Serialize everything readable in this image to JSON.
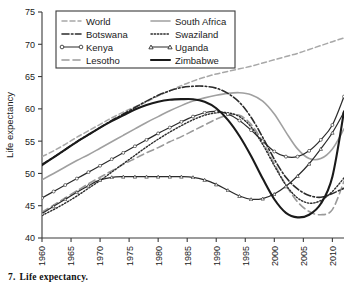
{
  "caption": {
    "number": "7.",
    "text": "Life expectancy."
  },
  "axes": {
    "ylabel": "Life expectancy",
    "xlabel": "",
    "yticks": [
      "40",
      "45",
      "50",
      "55",
      "60",
      "65",
      "70",
      "75"
    ],
    "xticks": [
      "1960",
      "1965",
      "1970",
      "1975",
      "1980",
      "1985",
      "1990",
      "1995",
      "2000",
      "2005",
      "2010"
    ]
  },
  "legend": {
    "entries": [
      {
        "label": "World",
        "style": "dashed-light"
      },
      {
        "label": "South Africa",
        "style": "solid-light"
      },
      {
        "label": "Botswana",
        "style": "dashdot"
      },
      {
        "label": "Swaziland",
        "style": "dotted"
      },
      {
        "label": "Kenya",
        "style": "solid-circle"
      },
      {
        "label": "Uganda",
        "style": "solid-triangle"
      },
      {
        "label": "Lesotho",
        "style": "dashed-long"
      },
      {
        "label": "Zimbabwe",
        "style": "solid-thick"
      }
    ]
  },
  "chart_data": {
    "type": "line",
    "title": "Life expectancy.",
    "xlabel": "",
    "ylabel": "Life expectancy",
    "xlim": [
      1960,
      2012
    ],
    "ylim": [
      40,
      75
    ],
    "grid": false,
    "legend_position": "top-left",
    "x": [
      1960,
      1962,
      1964,
      1966,
      1968,
      1970,
      1972,
      1974,
      1976,
      1978,
      1980,
      1982,
      1984,
      1986,
      1988,
      1990,
      1992,
      1994,
      1996,
      1998,
      2000,
      2002,
      2004,
      2006,
      2008,
      2010,
      2012
    ],
    "series": [
      {
        "name": "World",
        "values": [
          52.6,
          53.5,
          54.5,
          55.6,
          56.6,
          57.6,
          58.6,
          59.5,
          60.3,
          61.1,
          62.0,
          62.8,
          63.6,
          64.3,
          64.9,
          65.4,
          65.8,
          66.2,
          66.6,
          67.1,
          67.6,
          68.1,
          68.6,
          69.2,
          69.8,
          70.4,
          71.0
        ]
      },
      {
        "name": "Botswana",
        "values": [
          51.4,
          52.5,
          53.7,
          54.9,
          56.0,
          57.1,
          58.2,
          59.2,
          60.2,
          61.2,
          62.1,
          62.8,
          63.3,
          63.5,
          63.5,
          63.2,
          62.4,
          61.0,
          58.7,
          55.6,
          52.2,
          49.4,
          47.6,
          46.6,
          46.3,
          46.9,
          47.7
        ]
      },
      {
        "name": "Kenya",
        "values": [
          46.2,
          47.2,
          48.2,
          49.2,
          50.2,
          51.2,
          52.2,
          53.2,
          54.2,
          55.2,
          56.2,
          57.1,
          58.0,
          58.8,
          59.4,
          59.6,
          59.2,
          58.2,
          56.7,
          55.0,
          53.4,
          52.6,
          52.6,
          53.5,
          55.2,
          57.5,
          61.9
        ]
      },
      {
        "name": "Lesotho",
        "values": [
          44.0,
          45.1,
          46.2,
          47.3,
          48.4,
          49.4,
          50.4,
          51.4,
          52.3,
          53.2,
          54.0,
          54.9,
          55.7,
          56.6,
          57.5,
          58.4,
          59.0,
          59.0,
          57.6,
          54.9,
          51.5,
          48.2,
          45.6,
          44.1,
          43.6,
          44.4,
          48.8
        ]
      },
      {
        "name": "South Africa",
        "values": [
          49.0,
          50.0,
          51.0,
          52.0,
          52.9,
          53.9,
          54.9,
          55.9,
          56.9,
          57.9,
          58.8,
          59.7,
          60.5,
          61.2,
          61.7,
          62.1,
          62.4,
          62.5,
          62.2,
          61.2,
          59.2,
          56.4,
          53.8,
          52.3,
          52.3,
          53.8,
          56.9
        ]
      },
      {
        "name": "Swaziland",
        "values": [
          43.5,
          44.4,
          45.4,
          46.5,
          47.7,
          48.9,
          50.2,
          51.5,
          52.8,
          54.1,
          55.3,
          56.4,
          57.4,
          58.3,
          59.0,
          59.4,
          59.4,
          58.8,
          57.2,
          54.5,
          51.2,
          48.2,
          46.2,
          45.4,
          45.8,
          47.2,
          49.3
        ]
      },
      {
        "name": "Uganda",
        "values": [
          43.8,
          44.9,
          46.0,
          47.1,
          48.1,
          49.0,
          49.4,
          49.5,
          49.5,
          49.5,
          49.5,
          49.5,
          49.5,
          49.4,
          49.0,
          48.3,
          47.4,
          46.5,
          46.0,
          46.1,
          46.8,
          48.0,
          49.6,
          51.5,
          53.8,
          56.3,
          59.5
        ]
      },
      {
        "name": "Zimbabwe",
        "values": [
          51.3,
          52.5,
          53.7,
          54.9,
          56.0,
          57.1,
          58.1,
          59.0,
          59.9,
          60.6,
          61.1,
          61.4,
          61.5,
          61.5,
          61.1,
          60.1,
          58.3,
          55.8,
          52.7,
          49.2,
          46.0,
          43.9,
          43.2,
          43.6,
          45.3,
          49.5,
          59.6
        ]
      }
    ]
  }
}
